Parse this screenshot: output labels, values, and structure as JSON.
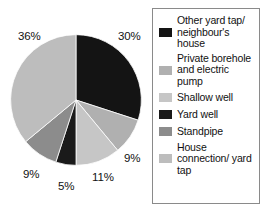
{
  "chart_data": {
    "type": "pie",
    "title": "",
    "subtitle": "",
    "xlabel": "",
    "ylabel": "",
    "legend_position": "right",
    "grid": false,
    "start_angle_deg": 0,
    "direction": "clockwise",
    "categories": [
      "Other yard tap/ neighbour's house",
      "Private borehole and electric pump",
      "Shallow well",
      "Yard well",
      "Standpipe",
      "House connection/ yard tap"
    ],
    "values": [
      30,
      9,
      11,
      5,
      9,
      36
    ],
    "value_labels": [
      "30%",
      "9%",
      "11%",
      "5%",
      "9%",
      "36%"
    ],
    "colors": [
      "#141414",
      "#b0b0b0",
      "#c6c6c6",
      "#1a1a1a",
      "#8c8c8c",
      "#bdbdbd"
    ],
    "units": "%"
  },
  "pie": {
    "slices": [
      {
        "name": "other-yard-tap",
        "label": "30%",
        "value": 30,
        "color": "#141414",
        "label_x": 118,
        "label_y": 30
      },
      {
        "name": "private-borehole",
        "label": "9%",
        "value": 9,
        "color": "#b0b0b0",
        "label_x": 124,
        "label_y": 152
      },
      {
        "name": "shallow-well",
        "label": "11%",
        "value": 11,
        "color": "#c6c6c6",
        "label_x": 92,
        "label_y": 171
      },
      {
        "name": "yard-well",
        "label": "5%",
        "value": 5,
        "color": "#1a1a1a",
        "label_x": 58,
        "label_y": 180
      },
      {
        "name": "standpipe",
        "label": "9%",
        "value": 9,
        "color": "#8c8c8c",
        "label_x": 23,
        "label_y": 168
      },
      {
        "name": "house-connection",
        "label": "36%",
        "value": 36,
        "color": "#bdbdbd",
        "label_x": 18,
        "label_y": 30
      }
    ]
  },
  "legend": {
    "items": [
      {
        "label": "Other yard tap/ neighbour's house",
        "color": "#141414"
      },
      {
        "label": "Private borehole and electric pump",
        "color": "#b0b0b0"
      },
      {
        "label": "Shallow well",
        "color": "#c6c6c6"
      },
      {
        "label": "Yard well",
        "color": "#1a1a1a"
      },
      {
        "label": "Standpipe",
        "color": "#8c8c8c"
      },
      {
        "label": "House connection/ yard tap",
        "color": "#bdbdbd"
      }
    ],
    "border_color": "#8a8a8a"
  }
}
